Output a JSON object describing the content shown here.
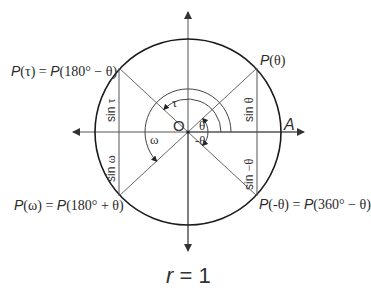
{
  "diagram": {
    "origin_label": "O",
    "point_A_label": "A",
    "caption": {
      "variable": "r",
      "equals": " = 1"
    },
    "points": {
      "theta": {
        "p": "P",
        "arg": "(θ)"
      },
      "tau": {
        "p": "P",
        "arg": "(τ)",
        "eq": " = ",
        "p2": "P",
        "arg2": "(180° − θ)"
      },
      "omega": {
        "p": "P",
        "arg": "(ω)",
        "eq": " = ",
        "p2": "P",
        "arg2": "(180° + θ)"
      },
      "neg_theta": {
        "p": "P",
        "arg": "(-θ)",
        "eq": " = ",
        "p2": "P",
        "arg2": "(360° − θ)"
      }
    },
    "sine_segments": {
      "theta": {
        "fn": "sin ",
        "arg": "θ"
      },
      "tau": {
        "fn": "sin ",
        "arg": "τ"
      },
      "omega": {
        "fn": "sin ",
        "arg": "ω"
      },
      "neg_theta": {
        "fn": "sin ",
        "arg": "−θ"
      }
    },
    "angle_labels": {
      "theta": "θ",
      "neg_theta": "-θ",
      "tau": "τ",
      "omega": "ω"
    },
    "geometry": {
      "center": [
        188,
        132
      ],
      "radius": 93,
      "angle_deg": 43
    },
    "colors": {
      "circle": "#1a1a1a",
      "axes": "#555555",
      "lines": "#666666",
      "text": "#2a2a2a"
    }
  }
}
